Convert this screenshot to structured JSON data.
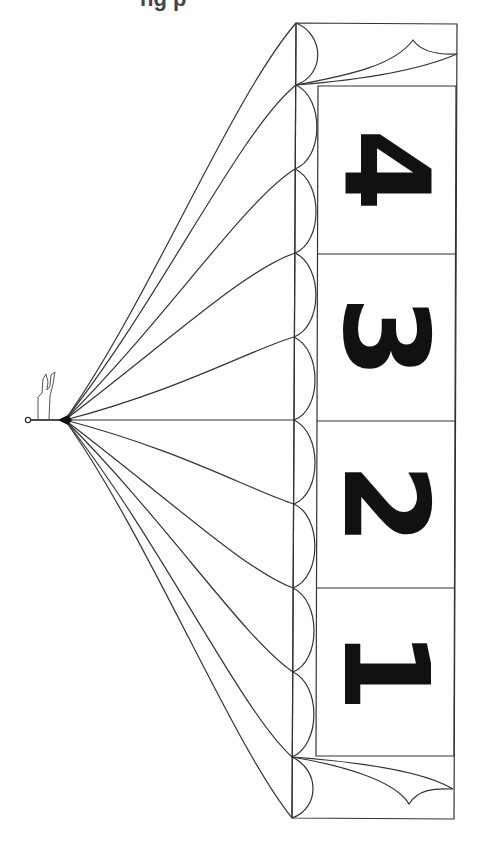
{
  "title_fragment": "ng p",
  "diagram": {
    "stroke_color": "#333333",
    "fill_color": "#111111",
    "apex": {
      "x": 65,
      "y": 420
    },
    "figure_anchor": {
      "x": 28,
      "y": 420
    },
    "scallop_vertices_y": [
      23,
      85,
      169,
      253,
      337,
      420,
      504,
      588,
      672,
      757,
      818
    ],
    "panels": [
      {
        "label": "4",
        "y_top": 86,
        "y_bottom": 254
      },
      {
        "label": "3",
        "y_top": 254,
        "y_bottom": 421
      },
      {
        "label": "2",
        "y_top": 421,
        "y_bottom": 588
      },
      {
        "label": "1",
        "y_top": 588,
        "y_bottom": 756
      }
    ]
  }
}
